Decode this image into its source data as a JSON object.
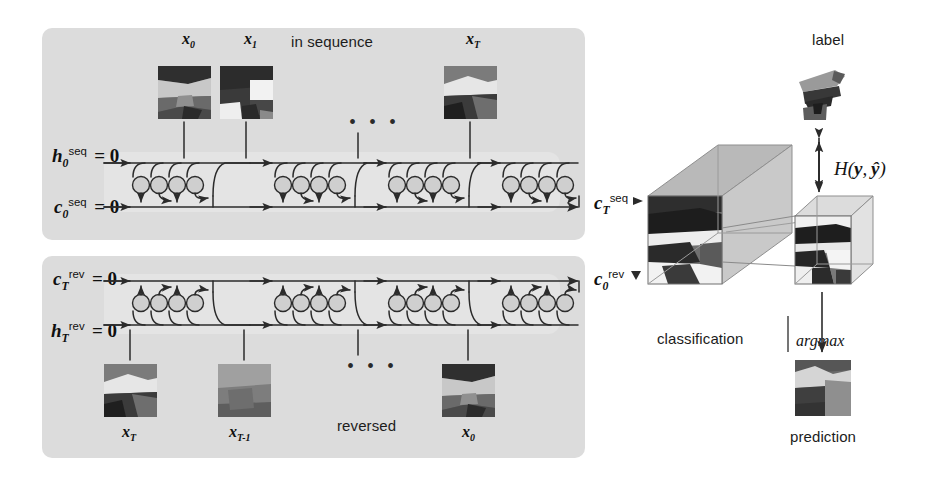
{
  "figure": {
    "type": "diagram",
    "background": "#ffffff",
    "panel_color": "#dcdcdc",
    "strip_color": "#e4e4e4",
    "ink_color": "#222222"
  },
  "top_panel": {
    "caption": "in sequence",
    "inputs": [
      {
        "label_x": "x",
        "label_sub": "0"
      },
      {
        "label_x": "x",
        "label_sub": "1"
      },
      {
        "ellipsis": "..."
      },
      {
        "label_x": "x",
        "label_sub": "T"
      }
    ],
    "state_labels": [
      {
        "sym": "h",
        "sub": "0",
        "sup": "seq",
        "eq": "= 0"
      },
      {
        "sym": "c",
        "sub": "0",
        "sup": "seq",
        "eq": "= 0"
      }
    ],
    "output_label": {
      "sym": "c",
      "sub": "T",
      "sup": "seq"
    },
    "cells": 4
  },
  "bottom_panel": {
    "caption": "reversed",
    "inputs": [
      {
        "label_x": "x",
        "label_sub": "T"
      },
      {
        "label_x": "x",
        "label_sub": "T-1"
      },
      {
        "ellipsis": "..."
      },
      {
        "label_x": "x",
        "label_sub": "0"
      }
    ],
    "state_labels": [
      {
        "sym": "c",
        "sub": "T",
        "sup": "rev",
        "eq": "= 0"
      },
      {
        "sym": "h",
        "sub": "T",
        "sup": "rev",
        "eq": "= 0"
      }
    ],
    "output_label": {
      "sym": "c",
      "sub": "0",
      "sup": "rev"
    },
    "cells": 4
  },
  "right_column": {
    "label_caption": "label",
    "loss_label": "H(y, ŷ)",
    "loss_sym": "H",
    "loss_args": "(y, ŷ)",
    "classification_caption": "classification",
    "argmax_caption": "argmax",
    "prediction_caption": "prediction"
  },
  "ellipsis_glyph": "• • •"
}
